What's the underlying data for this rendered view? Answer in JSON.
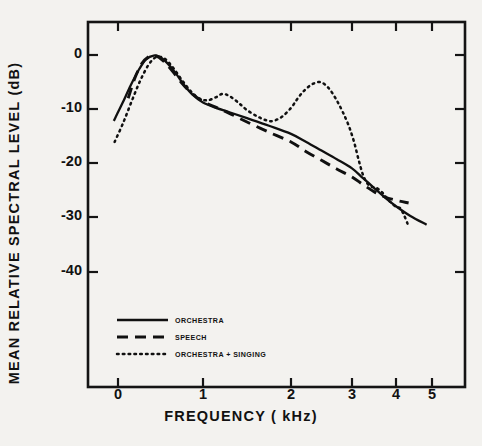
{
  "chart_data": {
    "type": "line",
    "title": "",
    "xlabel": "FREQUENCY  ( kHz)",
    "ylabel": "MEAN RELATIVE SPECTRAL LEVEL  (dB)",
    "xlim": [
      -0.25,
      5.55
    ],
    "ylim": [
      -46,
      4
    ],
    "grid": false,
    "x_scale_note": "non-linear (quasi-mel) frequency axis; tick pixel spacing compresses toward high frequency",
    "xticks": [
      0,
      1,
      2,
      3,
      4,
      5
    ],
    "xtick_labels": [
      "0",
      "1",
      "2",
      "3",
      "4",
      "5"
    ],
    "xtick_pixels": [
      118,
      203,
      291,
      352,
      396,
      432
    ],
    "yticks": [
      0,
      -10,
      -20,
      -30,
      -40
    ],
    "ytick_labels": [
      "0",
      "-10",
      "-20",
      "-30",
      "-40"
    ],
    "ytick_pixels": [
      55,
      109,
      163,
      217,
      272
    ],
    "legend_position": "lower-left inside axes",
    "series": [
      {
        "name": "ORCHESTRA",
        "style": "solid",
        "color": "#101010",
        "points": [
          [
            -0.05,
            -12.2
          ],
          [
            0.05,
            -9.0
          ],
          [
            0.15,
            -5.6
          ],
          [
            0.25,
            -2.6
          ],
          [
            0.33,
            -0.8
          ],
          [
            0.42,
            -0.1
          ],
          [
            0.5,
            -0.4
          ],
          [
            0.58,
            -1.5
          ],
          [
            0.68,
            -3.4
          ],
          [
            0.78,
            -5.6
          ],
          [
            0.88,
            -7.4
          ],
          [
            1.0,
            -8.8
          ],
          [
            1.15,
            -9.8
          ],
          [
            1.3,
            -10.6
          ],
          [
            1.5,
            -11.7
          ],
          [
            1.75,
            -13.1
          ],
          [
            2.0,
            -14.6
          ],
          [
            2.25,
            -16.1
          ],
          [
            2.5,
            -17.7
          ],
          [
            2.75,
            -19.3
          ],
          [
            3.0,
            -21.0
          ],
          [
            3.25,
            -22.8
          ],
          [
            3.5,
            -24.6
          ],
          [
            3.75,
            -26.4
          ],
          [
            4.0,
            -28.0
          ],
          [
            4.4,
            -29.8
          ],
          [
            4.85,
            -31.4
          ]
        ]
      },
      {
        "name": "SPEECH",
        "style": "dashed",
        "color": "#101010",
        "points": [
          [
            0.12,
            -8.0
          ],
          [
            0.2,
            -4.2
          ],
          [
            0.28,
            -1.6
          ],
          [
            0.36,
            -0.3
          ],
          [
            0.44,
            -0.1
          ],
          [
            0.54,
            -1.2
          ],
          [
            0.64,
            -3.0
          ],
          [
            0.75,
            -5.2
          ],
          [
            0.86,
            -7.0
          ],
          [
            1.0,
            -8.6
          ],
          [
            1.15,
            -9.7
          ],
          [
            1.3,
            -10.8
          ],
          [
            1.5,
            -12.4
          ],
          [
            1.75,
            -14.3
          ],
          [
            2.0,
            -16.1
          ],
          [
            2.25,
            -17.9
          ],
          [
            2.5,
            -19.5
          ],
          [
            2.75,
            -21.1
          ],
          [
            3.0,
            -22.6
          ],
          [
            3.25,
            -24.0
          ],
          [
            3.5,
            -25.3
          ],
          [
            3.75,
            -26.3
          ],
          [
            4.0,
            -26.9
          ],
          [
            4.35,
            -27.4
          ]
        ]
      },
      {
        "name": "ORCHESTRA + SINGING",
        "style": "dotted",
        "color": "#101010",
        "points": [
          [
            -0.04,
            -16.1
          ],
          [
            0.06,
            -12.6
          ],
          [
            0.16,
            -8.6
          ],
          [
            0.26,
            -4.8
          ],
          [
            0.36,
            -1.8
          ],
          [
            0.45,
            -0.4
          ],
          [
            0.55,
            -0.7
          ],
          [
            0.65,
            -2.4
          ],
          [
            0.75,
            -4.6
          ],
          [
            0.85,
            -6.6
          ],
          [
            0.95,
            -8.0
          ],
          [
            1.05,
            -8.4
          ],
          [
            1.15,
            -7.8
          ],
          [
            1.22,
            -7.2
          ],
          [
            1.3,
            -7.6
          ],
          [
            1.4,
            -8.8
          ],
          [
            1.5,
            -10.2
          ],
          [
            1.62,
            -11.4
          ],
          [
            1.72,
            -12.1
          ],
          [
            1.8,
            -12.2
          ],
          [
            1.9,
            -11.4
          ],
          [
            2.0,
            -9.8
          ],
          [
            2.1,
            -8.2
          ],
          [
            2.2,
            -6.8
          ],
          [
            2.32,
            -5.6
          ],
          [
            2.45,
            -5.0
          ],
          [
            2.55,
            -5.4
          ],
          [
            2.65,
            -6.6
          ],
          [
            2.75,
            -8.4
          ],
          [
            2.85,
            -10.6
          ],
          [
            2.95,
            -13.2
          ],
          [
            3.05,
            -16.2
          ],
          [
            3.15,
            -19.4
          ],
          [
            3.25,
            -22.2
          ],
          [
            3.35,
            -23.8
          ],
          [
            3.45,
            -24.4
          ],
          [
            3.55,
            -24.6
          ],
          [
            3.68,
            -25.4
          ],
          [
            3.8,
            -26.6
          ],
          [
            3.92,
            -27.6
          ],
          [
            4.02,
            -28.2
          ],
          [
            4.12,
            -28.4
          ],
          [
            4.22,
            -29.6
          ],
          [
            4.32,
            -31.2
          ]
        ]
      }
    ]
  },
  "axes": {
    "y_title": "MEAN  RELATIVE  SPECTRAL  LEVEL   (dB)",
    "x_title": "FREQUENCY    ( kHz)"
  },
  "legend": {
    "items": [
      {
        "label": "ORCHESTRA",
        "style": "solid"
      },
      {
        "label": "SPEECH",
        "style": "dashed"
      },
      {
        "label": "ORCHESTRA + SINGING",
        "style": "dotted"
      }
    ]
  }
}
